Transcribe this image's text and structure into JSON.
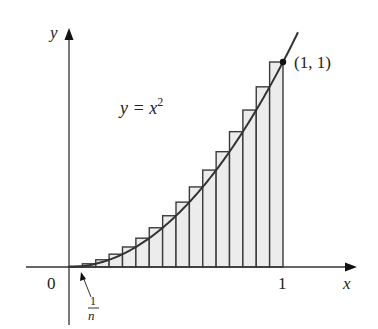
{
  "figure": {
    "n_rectangles": 16,
    "sample_point": "right endpoint",
    "function": "x^2",
    "interval": [
      0,
      1
    ]
  },
  "labels": {
    "y_axis": "y",
    "x_axis": "x",
    "origin": "0",
    "x_tick_1": "1",
    "curve_lhs": "y = x",
    "curve_exp": "2",
    "point": "(1, 1)",
    "width_num": "1",
    "width_den": "n"
  },
  "colors": {
    "rect_fill": "#ececec",
    "rect_stroke": "#3a3a3a",
    "axis": "#333333",
    "curve": "#333333",
    "text": "#222222"
  },
  "chart_data": {
    "type": "area",
    "title": "",
    "xlabel": "x",
    "ylabel": "y",
    "xlim": [
      0,
      1
    ],
    "ylim": [
      0,
      1
    ],
    "curve": {
      "name": "y = x^2",
      "x": [
        0,
        0.25,
        0.5,
        0.75,
        1
      ],
      "y": [
        0,
        0.0625,
        0.25,
        0.5625,
        1
      ]
    },
    "rectangles": {
      "n": 16,
      "width": 0.0625,
      "left_edges": [
        0,
        0.0625,
        0.125,
        0.1875,
        0.25,
        0.3125,
        0.375,
        0.4375,
        0.5,
        0.5625,
        0.625,
        0.6875,
        0.75,
        0.8125,
        0.875,
        0.9375
      ],
      "heights": [
        0.0039,
        0.0156,
        0.0352,
        0.0625,
        0.0977,
        0.1406,
        0.1914,
        0.25,
        0.3164,
        0.3906,
        0.4727,
        0.5625,
        0.6602,
        0.7656,
        0.8789,
        1.0
      ]
    },
    "annotations": [
      "y = x^2",
      "(1, 1)",
      "1/n",
      "0",
      "1"
    ],
    "grid": false
  }
}
